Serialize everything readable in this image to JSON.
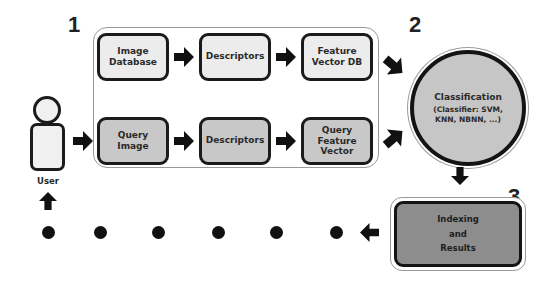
{
  "steps": {
    "one": "1",
    "two": "2",
    "three": "3"
  },
  "user": {
    "label": "User",
    "icon": "user-figure-icon"
  },
  "database_row": [
    {
      "label_line1": "Image",
      "label_line2": "Database"
    },
    {
      "label_line1": "Descriptors",
      "label_line2": ""
    },
    {
      "label_line1": "Feature",
      "label_line2": "Vector DB"
    }
  ],
  "query_row": [
    {
      "label_line1": "Query",
      "label_line2": "Image",
      "label_line3": ""
    },
    {
      "label_line1": "Descriptors",
      "label_line2": "",
      "label_line3": ""
    },
    {
      "label_line1": "Query",
      "label_line2": "Feature",
      "label_line3": "Vector"
    }
  ],
  "classification": {
    "title": "Classification",
    "detail_line1": "(Classifier: SVM,",
    "detail_line2": "KNN, NBNN, ...)"
  },
  "results": {
    "line1": "Indexing",
    "line2": "and",
    "line3": "Results"
  },
  "feedback_dots": 6,
  "colors": {
    "light_box": "#ececec",
    "mid_box": "#c8c8c8",
    "results_box": "#8d8d8d",
    "stroke": "#1b1b1b"
  }
}
